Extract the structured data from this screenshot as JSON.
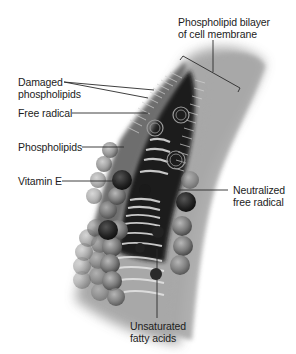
{
  "figure": {
    "labels": {
      "bilayer_line1": "Phospholipid bilayer",
      "bilayer_line2": "of cell membrane",
      "damaged_line1": "Damaged",
      "damaged_line2": "phospholipids",
      "free_radical": "Free radical",
      "phospholipids": "Phospholipids",
      "vitamin_e": "Vitamin E",
      "neutralized_line1": "Neutralized",
      "neutralized_line2": "free radical",
      "unsaturated_line1": "Unsaturated",
      "unsaturated_line2": "fatty acids"
    },
    "colors": {
      "background": "#ffffff",
      "membrane_dark": "#1e1e1e",
      "membrane_mid": "#6f6f6f",
      "membrane_light": "#b9b9b9",
      "leader_line": "#2a2a2a",
      "text": "#1c1c1c"
    }
  }
}
